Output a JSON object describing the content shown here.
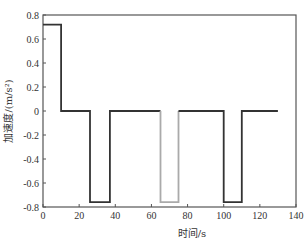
{
  "chart_data": {
    "type": "line",
    "title": "",
    "xlabel": "时间/s",
    "ylabel": "加速度/(m/s²)",
    "xlim": [
      0,
      140
    ],
    "ylim": [
      -0.8,
      0.8
    ],
    "xticks": [
      0,
      20,
      40,
      60,
      80,
      100,
      120,
      140
    ],
    "yticks": [
      0.8,
      0.6,
      0.4,
      0.2,
      0,
      -0.2,
      -0.4,
      -0.6,
      -0.8
    ],
    "xtick_labels": [
      "0",
      "20",
      "40",
      "60",
      "80",
      "100",
      "120",
      "140"
    ],
    "ytick_labels": [
      "0.8",
      "0.6",
      "0.4",
      "0.2",
      "0",
      "-0.2",
      "-0.4",
      "-0.6",
      "-0.8"
    ],
    "grid": false,
    "legend": null,
    "series": [
      {
        "name": "acceleration-dark",
        "color": "#333333",
        "points": [
          [
            0,
            0.72
          ],
          [
            10,
            0.72
          ],
          [
            10,
            0
          ],
          [
            26,
            0
          ],
          [
            26,
            -0.76
          ],
          [
            37,
            -0.76
          ],
          [
            37,
            0
          ],
          [
            65,
            0
          ]
        ]
      },
      {
        "name": "acceleration-gray-pulse",
        "color": "#aaaaaa",
        "points": [
          [
            65,
            0
          ],
          [
            65,
            -0.76
          ],
          [
            75,
            -0.76
          ],
          [
            75,
            0
          ]
        ]
      },
      {
        "name": "acceleration-dark-2",
        "color": "#333333",
        "points": [
          [
            75,
            0
          ],
          [
            100,
            0
          ],
          [
            100,
            -0.76
          ],
          [
            110,
            -0.76
          ],
          [
            110,
            0
          ],
          [
            130,
            0
          ]
        ]
      }
    ]
  }
}
